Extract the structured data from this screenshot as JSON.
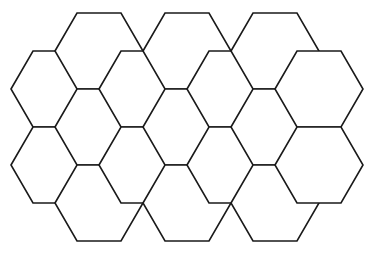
{
  "figure": {
    "background_color": "#ffffff",
    "stroke_color": "#1a1a1a",
    "fill_color": "#ffffff",
    "stroke_width": 1.6,
    "canvas": {
      "width": 384,
      "height": 253
    }
  },
  "geometry": {
    "orientation": "flat-top",
    "hex_width_point_to_point": 88,
    "hex_height_flat_to_flat": 76,
    "column_step_x": 44,
    "row_step_y": 76,
    "column_centers_x": [
      55,
      99,
      143,
      187,
      231,
      275,
      319
    ],
    "row_centers_y_even_columns": [
      51,
      127,
      203
    ],
    "row_centers_y_odd_columns": [
      89,
      165
    ]
  },
  "chart_data": {
    "type": "diagram",
    "shape": "hexagon",
    "orientation": "flat-top",
    "cell_count": 17,
    "columns": [
      {
        "name": "column-a",
        "center_x": 55,
        "cell_centers_y": [
          89,
          165
        ]
      },
      {
        "name": "column-b",
        "center_x": 99,
        "cell_centers_y": [
          51,
          127,
          203
        ]
      },
      {
        "name": "column-c",
        "center_x": 143,
        "cell_centers_y": [
          89,
          165
        ]
      },
      {
        "name": "column-d",
        "center_x": 187,
        "cell_centers_y": [
          51,
          127,
          203
        ]
      },
      {
        "name": "column-e",
        "center_x": 231,
        "cell_centers_y": [
          89,
          165
        ]
      },
      {
        "name": "column-f",
        "center_x": 275,
        "cell_centers_y": [
          51,
          127,
          203
        ]
      },
      {
        "name": "column-g",
        "center_x": 319,
        "cell_centers_y": [
          89,
          165
        ]
      }
    ],
    "cells": [
      {
        "id": "hex-a1",
        "cx": 55,
        "cy": 89
      },
      {
        "id": "hex-a2",
        "cx": 55,
        "cy": 165
      },
      {
        "id": "hex-b1",
        "cx": 99,
        "cy": 51
      },
      {
        "id": "hex-b2",
        "cx": 99,
        "cy": 127
      },
      {
        "id": "hex-b3",
        "cx": 99,
        "cy": 203
      },
      {
        "id": "hex-c1",
        "cx": 143,
        "cy": 89
      },
      {
        "id": "hex-c2",
        "cx": 143,
        "cy": 165
      },
      {
        "id": "hex-d1",
        "cx": 187,
        "cy": 51
      },
      {
        "id": "hex-d2",
        "cx": 187,
        "cy": 127
      },
      {
        "id": "hex-d3",
        "cx": 187,
        "cy": 203
      },
      {
        "id": "hex-e1",
        "cx": 231,
        "cy": 89
      },
      {
        "id": "hex-e2",
        "cx": 231,
        "cy": 165
      },
      {
        "id": "hex-f1",
        "cx": 275,
        "cy": 51
      },
      {
        "id": "hex-f2",
        "cx": 275,
        "cy": 127
      },
      {
        "id": "hex-f3",
        "cx": 275,
        "cy": 203
      },
      {
        "id": "hex-g1",
        "cx": 319,
        "cy": 89
      },
      {
        "id": "hex-g2",
        "cx": 319,
        "cy": 165
      }
    ],
    "xlabel": "",
    "ylabel": "",
    "legend": [],
    "annotations": [],
    "grid": false
  }
}
